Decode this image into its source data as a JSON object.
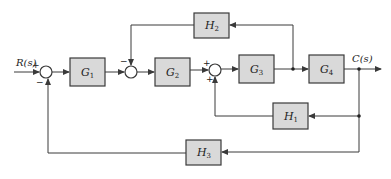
{
  "diagram": {
    "type": "block-diagram",
    "input_label": "R(s)",
    "output_label": "C(s)",
    "blocks": [
      {
        "id": "G1",
        "name": "G",
        "sub": "1"
      },
      {
        "id": "G2",
        "name": "G",
        "sub": "2"
      },
      {
        "id": "G3",
        "name": "G",
        "sub": "3"
      },
      {
        "id": "G4",
        "name": "G",
        "sub": "4"
      },
      {
        "id": "H1",
        "name": "H",
        "sub": "1"
      },
      {
        "id": "H2",
        "name": "H",
        "sub": "2"
      },
      {
        "id": "H3",
        "name": "H",
        "sub": "3"
      }
    ],
    "summing_junctions": [
      {
        "id": "S1",
        "signs": {
          "input": "+",
          "feedback": "−"
        }
      },
      {
        "id": "S2",
        "signs": {
          "feedback": "−"
        }
      },
      {
        "id": "S3",
        "signs": {
          "input": "+",
          "feedback": "+"
        }
      }
    ],
    "connections": [
      "R(s) -> S1 (+)",
      "S1 -> G1",
      "G1 -> S2",
      "S2 -> G2",
      "G2 -> S3 (+)",
      "S3 -> G3",
      "G3 -> G4",
      "G4 -> C(s)",
      "G3 output -> H2 -> S2 (−)",
      "C(s) -> H1 -> S3 (+)",
      "C(s) -> H3 -> S1 (−)"
    ]
  }
}
